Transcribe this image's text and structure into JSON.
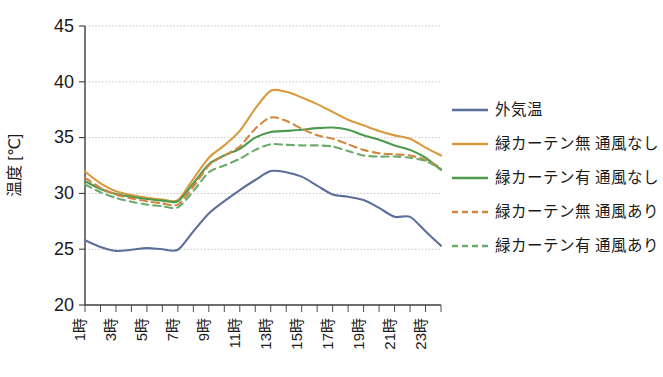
{
  "chart_data": {
    "type": "line",
    "title": "",
    "xlabel": "",
    "ylabel": "温度 [℃]",
    "ylim": [
      20,
      45
    ],
    "ytick_labels": [
      "20",
      "25",
      "30",
      "35",
      "40",
      "45"
    ],
    "ytick_values": [
      20,
      25,
      30,
      35,
      40,
      45
    ],
    "grid": true,
    "grid_axis": "y",
    "legend_position": "right",
    "x": [
      1,
      2,
      3,
      4,
      5,
      6,
      7,
      8,
      9,
      10,
      11,
      12,
      13,
      14,
      15,
      16,
      17,
      18,
      19,
      20,
      21,
      22,
      23,
      24
    ],
    "xtick_labels": [
      "1時",
      "",
      "3時",
      "",
      "5時",
      "",
      "7時",
      "",
      "9時",
      "",
      "11時",
      "",
      "13時",
      "",
      "15時",
      "",
      "17時",
      "",
      "19時",
      "",
      "21時",
      "",
      "23時",
      ""
    ],
    "xtick_labels_shown": [
      "1時",
      "3時",
      "5時",
      "7時",
      "9時",
      "11時",
      "13時",
      "15時",
      "17時",
      "19時",
      "21時",
      "23時"
    ],
    "series": [
      {
        "name": "外気温",
        "color": "#5b6e9c",
        "dash": "solid",
        "values": [
          25.8,
          25.2,
          24.85,
          24.95,
          25.1,
          25.0,
          24.95,
          26.6,
          28.2,
          29.3,
          30.3,
          31.2,
          32.0,
          31.9,
          31.5,
          30.7,
          29.9,
          29.7,
          29.4,
          28.7,
          27.9,
          27.9,
          26.6,
          25.3
        ]
      },
      {
        "name": "緑カーテン無 通風なし",
        "color": "#d89a3f",
        "dash": "solid",
        "values": [
          31.95,
          30.9,
          30.2,
          29.85,
          29.6,
          29.45,
          29.4,
          31.3,
          33.2,
          34.3,
          35.6,
          37.6,
          39.2,
          39.1,
          38.6,
          38.0,
          37.3,
          36.6,
          36.1,
          35.6,
          35.2,
          34.9,
          34.1,
          33.4
        ]
      },
      {
        "name": "緑カーテン有 通風なし",
        "color": "#4d9a4d",
        "dash": "solid",
        "values": [
          31.1,
          30.4,
          29.95,
          29.7,
          29.5,
          29.35,
          29.3,
          30.9,
          32.6,
          33.4,
          34.0,
          35.0,
          35.5,
          35.6,
          35.7,
          35.85,
          35.9,
          35.7,
          35.2,
          34.8,
          34.3,
          33.9,
          33.2,
          32.1
        ]
      },
      {
        "name": "緑カーテン無 通風あり",
        "color": "#d2853c",
        "dash": "dashed",
        "values": [
          31.4,
          30.5,
          29.9,
          29.55,
          29.3,
          29.1,
          29.0,
          30.6,
          32.5,
          33.4,
          34.2,
          35.8,
          36.8,
          36.5,
          35.8,
          35.2,
          34.9,
          34.4,
          33.9,
          33.6,
          33.5,
          33.4,
          33.0,
          32.3
        ]
      },
      {
        "name": "緑カーテン有 通風あり",
        "color": "#6bab6b",
        "dash": "dashed",
        "values": [
          30.8,
          30.1,
          29.6,
          29.25,
          29.0,
          28.85,
          28.75,
          30.2,
          31.9,
          32.5,
          33.1,
          33.9,
          34.4,
          34.35,
          34.3,
          34.3,
          34.2,
          33.8,
          33.4,
          33.3,
          33.3,
          33.2,
          32.9,
          32.2
        ]
      }
    ]
  }
}
